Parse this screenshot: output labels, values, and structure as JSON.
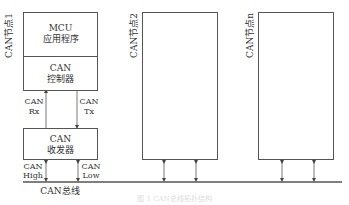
{
  "diagram": {
    "title": "CAN总线拓扑结构",
    "caption": "图 1  CAN总线拓扑结构",
    "bus_label": "CAN总线",
    "nodes": [
      {
        "label": "CAN节点1",
        "blocks": [
          {
            "line1": "MCU",
            "line2": "应用程序"
          },
          {
            "line1": "CAN",
            "line2": "控制器"
          },
          {
            "line1": "CAN",
            "line2": "收发器"
          }
        ],
        "signals": {
          "rx": {
            "line1": "CAN",
            "line2": "Rx"
          },
          "tx": {
            "line1": "CAN",
            "line2": "Tx"
          },
          "high": {
            "line1": "CAN",
            "line2": "High"
          },
          "low": {
            "line1": "CAN",
            "line2": "Low"
          }
        }
      },
      {
        "label": "CAN节点2"
      },
      {
        "label": "CAN节点n"
      }
    ],
    "colors": {
      "line": "#555555",
      "text": "#333333",
      "background": "#ffffff"
    }
  }
}
